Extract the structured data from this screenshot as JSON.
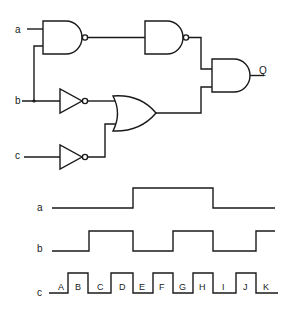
{
  "circuit": {
    "inputs": [
      {
        "label": "a"
      },
      {
        "label": "b"
      },
      {
        "label": "c"
      }
    ],
    "output": {
      "label": "Q"
    },
    "gates": [
      {
        "type": "NAND",
        "inputs": [
          "a",
          "b"
        ]
      },
      {
        "type": "NOT",
        "inputs": [
          "b"
        ]
      },
      {
        "type": "NOT",
        "inputs": [
          "c"
        ]
      },
      {
        "type": "OR",
        "inputs": [
          "NOT b",
          "NOT c"
        ]
      },
      {
        "type": "NAND",
        "inputs": [
          "NAND(a,b)"
        ]
      },
      {
        "type": "AND",
        "inputs": [
          "NAND(NAND(a,b))",
          "OR(NOT b, NOT c)"
        ],
        "output": "Q"
      }
    ]
  },
  "timing": {
    "signals": [
      {
        "label": "a",
        "levels": [
          0,
          0,
          0,
          0,
          1,
          1,
          1,
          1,
          0,
          0,
          0
        ]
      },
      {
        "label": "b",
        "levels": [
          0,
          0,
          1,
          1,
          0,
          0,
          1,
          1,
          0,
          0,
          1
        ]
      },
      {
        "label": "c",
        "levels": [
          0,
          1,
          0,
          1,
          0,
          1,
          0,
          1,
          0,
          1,
          0
        ]
      }
    ],
    "intervals": [
      "A",
      "B",
      "C",
      "D",
      "E",
      "F",
      "G",
      "H",
      "I",
      "J",
      "K"
    ]
  },
  "colors": {
    "ink": "#1a1a1a",
    "background": "#ffffff"
  }
}
